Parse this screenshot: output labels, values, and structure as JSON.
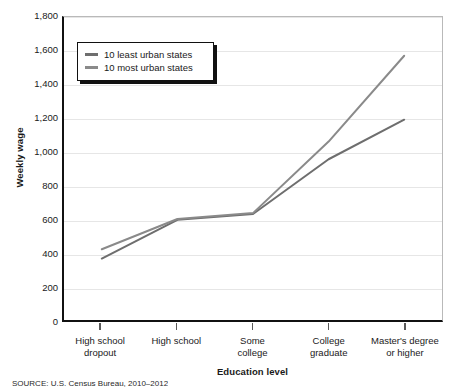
{
  "chart_data": {
    "type": "line",
    "title": "",
    "xlabel": "Education level",
    "ylabel": "Weekly wage",
    "categories": [
      "High school dropout",
      "High school",
      "Some college",
      "College graduate",
      "Master's degree or higher"
    ],
    "category_lines": [
      [
        "High school",
        "dropout"
      ],
      [
        "High school",
        ""
      ],
      [
        "Some",
        "college"
      ],
      [
        "College",
        "graduate"
      ],
      [
        "Master's degree",
        "or higher"
      ]
    ],
    "series": [
      {
        "name": "10 least urban states",
        "color": "#6e6e6e",
        "values": [
          365,
          595,
          630,
          955,
          1190
        ]
      },
      {
        "name": "10 most urban states",
        "color": "#8a8a8a",
        "values": [
          420,
          600,
          635,
          1060,
          1570
        ]
      }
    ],
    "ylim": [
      0,
      1800
    ],
    "ytick_values": [
      0,
      200,
      400,
      600,
      800,
      1000,
      1200,
      1400,
      1600,
      1800
    ],
    "ytick_labels": [
      "0",
      "200",
      "400",
      "600",
      "800",
      "1,000",
      "1,200",
      "1,400",
      "1,600",
      "1,800"
    ],
    "grid": true,
    "grid_axis": "y",
    "legend_position": "upper-left-inside"
  },
  "legend": {
    "entries": [
      {
        "label": "10 least urban states",
        "color": "#6e6e6e"
      },
      {
        "label": "10 most urban states",
        "color": "#8a8a8a"
      }
    ]
  },
  "axes": {
    "y_title": "Weekly wage",
    "x_title": "Education level"
  },
  "footer": {
    "source": "SOURCE: U.S. Census Bureau, 2010–2012"
  }
}
